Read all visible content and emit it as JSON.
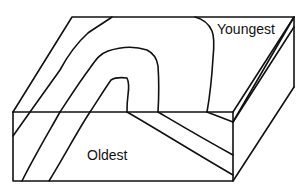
{
  "diagram": {
    "type": "geologic-block-diagram",
    "labels": {
      "youngest": "Youngest",
      "oldest": "Oldest"
    },
    "colors": {
      "line": "#111111",
      "background": "#ffffff"
    }
  }
}
